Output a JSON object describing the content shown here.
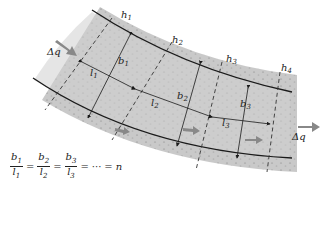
{
  "diagram": {
    "type": "flow-net",
    "labels": {
      "h1": "h",
      "h2": "h",
      "h3": "h",
      "h4": "h",
      "h_subs": [
        "1",
        "2",
        "3",
        "4"
      ],
      "b": "b",
      "b_subs": [
        "1",
        "2",
        "3"
      ],
      "l": "l",
      "l_subs": [
        "1",
        "2",
        "3"
      ],
      "dq_in": "Δq",
      "dq_out": "Δq"
    },
    "equation": {
      "fractions": [
        {
          "num": "b",
          "num_sub": "1",
          "den": "l",
          "den_sub": "1"
        },
        {
          "num": "b",
          "num_sub": "2",
          "den": "l",
          "den_sub": "2"
        },
        {
          "num": "b",
          "num_sub": "3",
          "den": "l",
          "den_sub": "3"
        }
      ],
      "equals": "=",
      "ellipsis": "···",
      "result": "n"
    },
    "colors": {
      "band": "#c8c8c8",
      "speckle": "#9a9a9a",
      "line": "#1a1a1a",
      "arrow_fill": "#888888"
    }
  }
}
